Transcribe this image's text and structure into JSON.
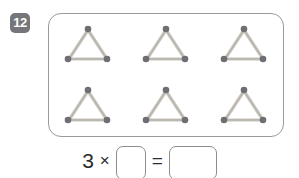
{
  "exercise": {
    "number_label": "12"
  },
  "panel": {
    "name": "matchstick-triangle-grid",
    "rows": 2,
    "columns": 3,
    "total_shapes": 6,
    "shape": "triangle",
    "matchsticks_per_shape": 3,
    "items": [
      {
        "id": "triangle-1",
        "label": "matchstick triangle"
      },
      {
        "id": "triangle-2",
        "label": "matchstick triangle"
      },
      {
        "id": "triangle-3",
        "label": "matchstick triangle"
      },
      {
        "id": "triangle-4",
        "label": "matchstick triangle"
      },
      {
        "id": "triangle-5",
        "label": "matchstick triangle"
      },
      {
        "id": "triangle-6",
        "label": "matchstick triangle"
      }
    ]
  },
  "equation": {
    "factor": "3",
    "times_symbol": "×",
    "equals_symbol": "=",
    "factor_box_value": "",
    "product_box_value": ""
  },
  "colors": {
    "badge_background": "#76767a",
    "badge_text": "#ffffff",
    "panel_border": "#9a9a9a",
    "box_border": "#8d8d8d",
    "matchstick_body": "#d9d6cf",
    "matchstick_body_edge": "#a8a49c",
    "matchstick_head": "#6f6f73",
    "text": "#2b2b2b",
    "page_background": "#ffffff"
  }
}
